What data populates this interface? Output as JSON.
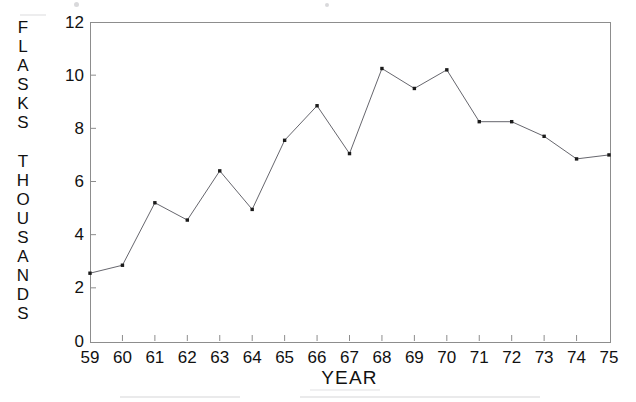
{
  "chart_data": {
    "type": "line",
    "title": "",
    "xlabel": "YEAR",
    "ylabel": "FLASKS THOUSANDS",
    "ylabel_lines": [
      "FLASKS",
      "THOUSANDS"
    ],
    "categories": [
      "59",
      "60",
      "61",
      "62",
      "63",
      "64",
      "65",
      "66",
      "67",
      "68",
      "69",
      "70",
      "71",
      "72",
      "73",
      "74",
      "75"
    ],
    "x": [
      59,
      60,
      61,
      62,
      63,
      64,
      65,
      66,
      67,
      68,
      69,
      70,
      71,
      72,
      73,
      74,
      75
    ],
    "values": [
      2.55,
      2.85,
      5.2,
      4.55,
      6.4,
      4.95,
      7.55,
      8.85,
      7.05,
      10.25,
      9.5,
      10.2,
      8.25,
      8.25,
      7.7,
      6.85,
      7.0
    ],
    "xlim": [
      59,
      75
    ],
    "ylim": [
      0,
      12
    ],
    "yticks": [
      0,
      2,
      4,
      6,
      8,
      10,
      12
    ],
    "ytick_labels": [
      "0",
      "2",
      "4",
      "6",
      "8",
      "10",
      "12"
    ],
    "xticks": [
      59,
      60,
      61,
      62,
      63,
      64,
      65,
      66,
      67,
      68,
      69,
      70,
      71,
      72,
      73,
      74,
      75
    ],
    "grid": false,
    "legend": null,
    "marker": "square",
    "line_color": "#55555c",
    "marker_color": "#1b1b1b",
    "axis_color": "#8d8d8d",
    "background": "#ffffff"
  }
}
